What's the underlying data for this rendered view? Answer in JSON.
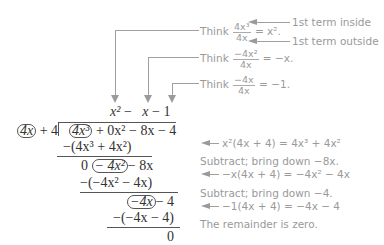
{
  "annotations": {
    "think1": {
      "prefix": "Think",
      "num": "4x³",
      "den": "4x",
      "result": "= x²."
    },
    "think2": {
      "prefix": "Think",
      "num": "−4x²",
      "den": "4x",
      "result": "= −x."
    },
    "think3": {
      "prefix": "Think",
      "num": "−4x",
      "den": "4x",
      "result": "= −1."
    },
    "label_inside": "1st term inside",
    "label_outside": "1st term outside"
  },
  "division": {
    "quotient": [
      "x²",
      "−",
      "x",
      "−",
      "1"
    ],
    "divisor_lead": "4x",
    "divisor_rest": "+ 4",
    "dividend_lead": "4x³",
    "dividend_rest": "+ 0x² − 8x − 4",
    "step1_sub": "−(4x³ + 4x²)",
    "step1_zero": "0",
    "step1_lead": "− 4x²",
    "step1_rest": "− 8x",
    "step2_sub": "−(−4x² − 4x)",
    "step2_lead": "−4x",
    "step2_rest": "− 4",
    "step3_sub": "−(−4x − 4)",
    "remainder": "0"
  },
  "explanations": [
    "x²(4x + 4) = 4x³ + 4x²",
    "Subtract; bring down −8x.",
    "−x(4x + 4) = −4x² − 4x",
    "Subtract; bring down −4.",
    "−1(4x + 4) = −4x − 4",
    "The remainder is zero."
  ]
}
